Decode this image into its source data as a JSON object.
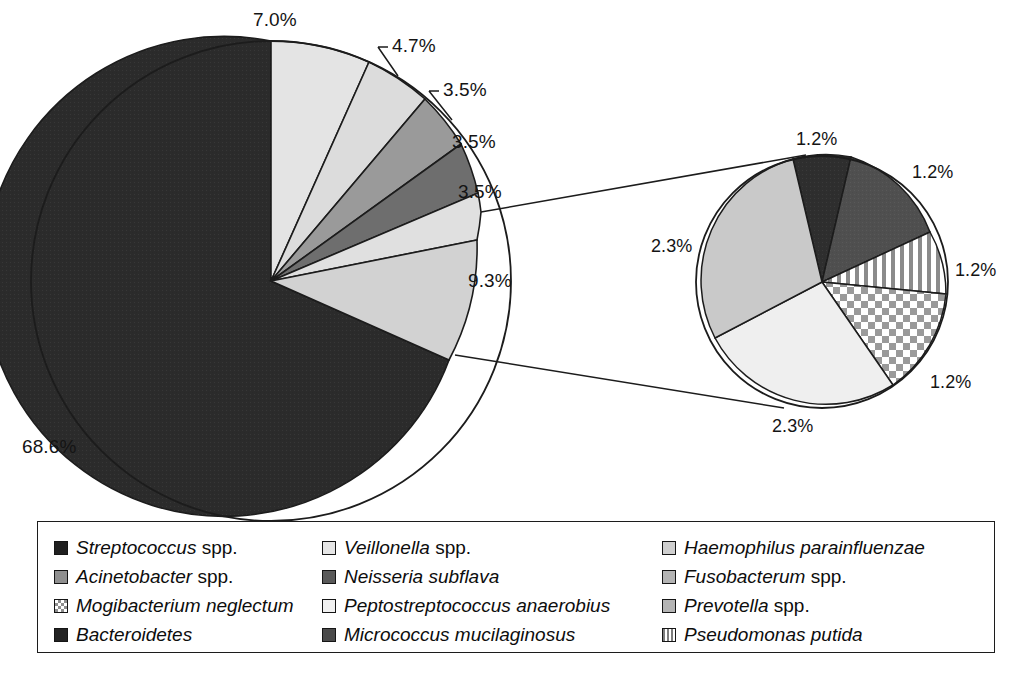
{
  "chart_data": {
    "type": "pie",
    "title": "",
    "subtitle": "",
    "xlabel": "",
    "ylabel": "",
    "grid": false,
    "legend_position": "bottom",
    "value_suffix": "%",
    "main_pie": {
      "start_angle_deg": -8,
      "direction": "clockwise",
      "categories": [
        "Streptococcus spp.",
        "Veillonella spp.",
        "Haemophilus parainfluenzae",
        "Acinetobacter spp.",
        "Neisseria subflava",
        "Fusobacterum spp.",
        "other (exploded)"
      ],
      "values": [
        68.6,
        7.0,
        4.7,
        3.5,
        3.5,
        3.5,
        9.3
      ],
      "labels": [
        "68.6%",
        "7.0%",
        "4.7%",
        "3.5%",
        "3.5%",
        "3.5%",
        "9.3%"
      ],
      "fills": [
        "#2b2b2b",
        "#e4e4e4",
        "#dcdcdc",
        "#9a9a9a",
        "#6e6e6e",
        "#e0e0e0",
        "#d2d2d2"
      ],
      "patterns": [
        "solid",
        "solid",
        "solid",
        "solid",
        "solid",
        "solid",
        "solid"
      ]
    },
    "exploded_pie": {
      "source_slice_label": "9.3%",
      "start_angle_deg": -76,
      "direction": "clockwise",
      "categories": [
        "Bacteroidetes",
        "Micrococcus mucilaginosus",
        "Pseudomonas putida",
        "Mogibacterium neglectum",
        "Peptostreptococcus anaerobius",
        "Prevotella spp."
      ],
      "values": [
        1.2,
        1.2,
        1.2,
        1.2,
        2.3,
        2.3
      ],
      "labels": [
        "1.2%",
        "1.2%",
        "1.2%",
        "1.2%",
        "2.3%",
        "2.3%"
      ],
      "fills": [
        "#2e2e2e",
        "#4f4f4f",
        "#ffffff",
        "#ffffff",
        "#efefef",
        "#c9c9c9"
      ],
      "patterns": [
        "solid",
        "solid",
        "vertical-stripes",
        "checkerboard",
        "solid",
        "solid"
      ]
    },
    "callout_labels": {
      "main": [
        {
          "text": "7.0%",
          "x": 253,
          "y": 10,
          "leader": false
        },
        {
          "text": "4.7%",
          "x": 392,
          "y": 40,
          "leader": true
        },
        {
          "text": "3.5%",
          "x": 443,
          "y": 84,
          "leader": true
        },
        {
          "text": "3.5%",
          "x": 452,
          "y": 136,
          "leader": false
        },
        {
          "text": "3.5%",
          "x": 458,
          "y": 186,
          "leader": false
        },
        {
          "text": "9.3%",
          "x": 468,
          "y": 274,
          "leader": false
        },
        {
          "text": "68.6%",
          "x": 22,
          "y": 440,
          "leader": false
        }
      ],
      "exploded": [
        {
          "text": "1.2%",
          "x": 796,
          "y": 133
        },
        {
          "text": "1.2%",
          "x": 912,
          "y": 166
        },
        {
          "text": "1.2%",
          "x": 955,
          "y": 264
        },
        {
          "text": "1.2%",
          "x": 930,
          "y": 376
        },
        {
          "text": "2.3%",
          "x": 651,
          "y": 240
        },
        {
          "text": "2.3%",
          "x": 772,
          "y": 420
        }
      ]
    }
  },
  "legend": {
    "columns": 3,
    "rows": 4,
    "entries": [
      {
        "name": "Streptococcus",
        "italic": "Streptococcus",
        "roman": " spp.",
        "swatch": "sw-black",
        "icon": "legend-swatch-solid-black"
      },
      {
        "name": "Veillonella",
        "italic": "Veillonella",
        "roman": " spp.",
        "swatch": "sw-vlight",
        "icon": "legend-swatch-solid-very-light-gray"
      },
      {
        "name": "Haemophilus",
        "italic": "Haemophilus parainfluenzae",
        "roman": "",
        "swatch": "sw-light",
        "icon": "legend-swatch-solid-light-gray"
      },
      {
        "name": "Acinetobacter",
        "italic": "Acinetobacter",
        "roman": " spp.",
        "swatch": "sw-mid",
        "icon": "legend-swatch-solid-medium-gray"
      },
      {
        "name": "Neisseria",
        "italic": "Neisseria subflava",
        "roman": "",
        "swatch": "sw-darkgray",
        "icon": "legend-swatch-solid-dark-gray"
      },
      {
        "name": "Fusobacterum",
        "italic": "Fusobacterum",
        "roman": " spp.",
        "swatch": "sw-midlight",
        "icon": "legend-swatch-solid-mid-light-gray"
      },
      {
        "name": "Mogibacterium",
        "italic": "Mogibacterium neglectum",
        "roman": "",
        "swatch": "sw-check",
        "icon": "legend-swatch-checkerboard"
      },
      {
        "name": "Peptostreptococcus",
        "italic": "Peptostreptococcus anaerobius",
        "roman": "",
        "swatch": "sw-xlight",
        "icon": "legend-swatch-solid-near-white"
      },
      {
        "name": "Prevotella",
        "italic": "Prevotella",
        "roman": " spp.",
        "swatch": "sw-midlight",
        "icon": "legend-swatch-solid-mid-light-gray"
      },
      {
        "name": "Bacteroidetes",
        "italic": "Bacteroidetes",
        "roman": "",
        "swatch": "sw-vdark",
        "icon": "legend-swatch-solid-very-dark"
      },
      {
        "name": "Micrococcus",
        "italic": "Micrococcus mucilaginosus",
        "roman": "",
        "swatch": "sw-dark",
        "icon": "legend-swatch-solid-dark"
      },
      {
        "name": "Pseudomonas",
        "italic": "Pseudomonas putida",
        "roman": "",
        "swatch": "sw-vstripe",
        "icon": "legend-swatch-vertical-stripes"
      }
    ]
  },
  "colors": {
    "stroke": "#1c1c1c",
    "background": "#ffffff",
    "text": "#121212"
  }
}
